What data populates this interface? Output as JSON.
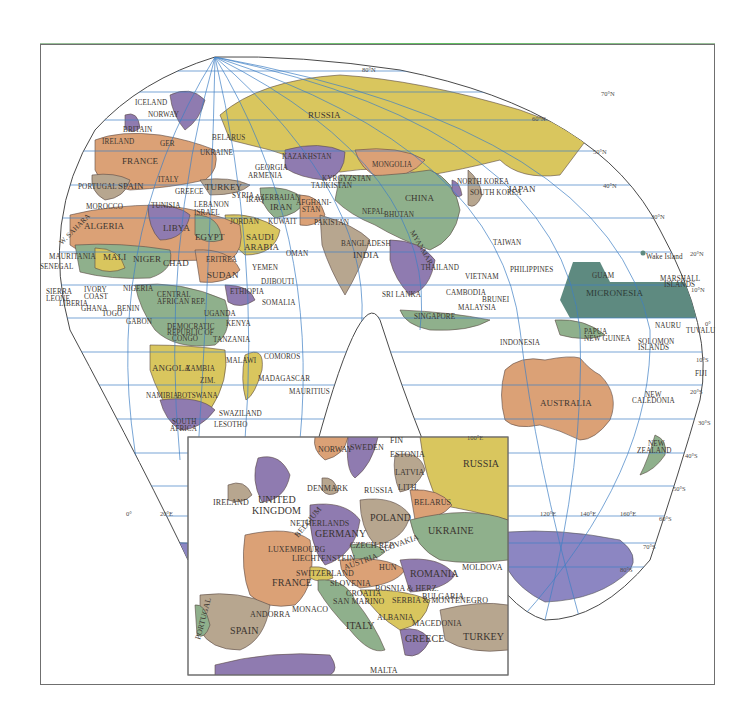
{
  "map": {
    "title": "World political map (Eurasia-centered) with Europe inset",
    "colors": {
      "yellow": "#d9c65e",
      "orange": "#dba176",
      "purple": "#8f7bb0",
      "green": "#8fb08c",
      "tan": "#b7a68f",
      "teal": "#5e8a80",
      "antarctica": "#8c86c2",
      "water": "#ffffff",
      "grid": "#3f7fc4",
      "border": "#5a4a44",
      "frame": "#6f6f6f"
    },
    "latitude_labels": [
      "80°N",
      "70°N",
      "60°N",
      "50°N",
      "40°N",
      "30°N",
      "20°N",
      "10°N",
      "0°",
      "10°S",
      "20°S",
      "30°S",
      "40°S",
      "50°S",
      "60°S",
      "70°S",
      "80°S"
    ],
    "longitude_labels": [
      "0°",
      "20°E",
      "100°E",
      "120°E",
      "140°E",
      "160°E"
    ],
    "countries": {
      "europe": [
        "ICELAND",
        "NORWAY",
        "SWEDEN",
        "BRITAIN",
        "IRELAND",
        "GER",
        "BELARUS",
        "UKRAINE",
        "FRANCE",
        "PORTUGAL",
        "SPAIN",
        "ITALY",
        "GREECE",
        "TURKEY"
      ],
      "asia": [
        "RUSSIA",
        "KAZAKHSTAN",
        "MONGOLIA",
        "KYRGYZSTAN",
        "TAJIKISTAN",
        "CHINA",
        "NORTH KOREA",
        "SOUTH KOREA",
        "JAPAN",
        "GEORGIA",
        "ARMENIA",
        "AZERBAIJAN",
        "IRAN",
        "IRAQ",
        "SYRIA",
        "LEBANON",
        "ISRAEL",
        "JORDAN",
        "KUWAIT",
        "SAUDI ARABIA",
        "YEMEN",
        "OMAN",
        "AFGHANISTAN",
        "PAKISTAN",
        "NEPAL",
        "BHUTAN",
        "BANGLADESH",
        "INDIA",
        "SRI LANKA",
        "MYANMAR",
        "THAILAND",
        "VIETNAM",
        "CAMBODIA",
        "MALAYSIA",
        "SINGAPORE",
        "BRUNEI",
        "PHILIPPINES",
        "TAIWAN",
        "INDONESIA"
      ],
      "africa": [
        "MOROCCO",
        "TUNISIA",
        "ALGERIA",
        "LIBYA",
        "EGYPT",
        "WESTERN SAHARA",
        "MAURITANIA",
        "MALI",
        "NIGER",
        "CHAD",
        "SUDAN",
        "ERITREA",
        "DJIBOUTI",
        "ETHIOPIA",
        "SOMALIA",
        "SENEGAL",
        "SIERRA LEONE",
        "LIBERIA",
        "IVORY COAST",
        "GHANA",
        "TOGO",
        "BENIN",
        "NIGERIA",
        "CENTRAL AFRICAN REP.",
        "GABON",
        "DEMOCRATIC REPUBLIC OF CONGO",
        "UGANDA",
        "KENYA",
        "TANZANIA",
        "COMOROS",
        "MALAWI",
        "ANGOLA",
        "ZAMBIA",
        "ZIMBABWE",
        "NAMIBIA",
        "BOTSWANA",
        "MADAGASCAR",
        "MAURITIUS",
        "SWAZILAND",
        "LESOTHO",
        "SOUTH AFRICA"
      ],
      "oceania": [
        "AUSTRALIA",
        "PAPUA NEW GUINEA",
        "SOLOMON ISLANDS",
        "NAURU",
        "TUVALU",
        "FIJI",
        "NEW CALEDONIA",
        "NEW ZEALAND",
        "MICRONESIA",
        "GUAM",
        "MARSHALL ISLANDS",
        "Wake Island"
      ]
    },
    "inset": {
      "title": "Europe",
      "countries": [
        "NORWAY",
        "SWEDEN",
        "FIN",
        "ESTONIA",
        "LATVIA",
        "LITH.",
        "RUSSIA",
        "DENMARK",
        "IRELAND",
        "UNITED KINGDOM",
        "NETHERLANDS",
        "BELGIUM",
        "GERMANY",
        "POLAND",
        "BELARUS",
        "UKRAINE",
        "LUXEMBOURG",
        "LIECHTENSTEIN",
        "CZECH REP.",
        "SLOVAKIA",
        "AUSTRIA",
        "HUN",
        "MOLDOVA",
        "ROMANIA",
        "SWITZERLAND",
        "FRANCE",
        "SLOVENIA",
        "CROATIA",
        "BOSNIA & HERZ.",
        "SERBIA & MONTENEGRO",
        "BULGARIA",
        "SAN MARINO",
        "MONACO",
        "ANDORRA",
        "PORTUGAL",
        "SPAIN",
        "ITALY",
        "ALBANIA",
        "MACEDONIA",
        "GREECE",
        "TURKEY",
        "MALTA"
      ]
    }
  },
  "labels": {
    "lat80": "80°N",
    "lat70": "70°N",
    "lat60": "60°N",
    "lat50": "50°N",
    "lat40": "40°N",
    "lat30": "30°N",
    "lat20": "20°N",
    "lat10": "10°N",
    "lat0": "0°",
    "lat10s": "10°S",
    "lat20s": "20°S",
    "lat30s": "30°S",
    "lat40s": "40°S",
    "lat50s": "50°S",
    "lat60s": "60°S",
    "lat70s": "70°S",
    "lat80s": "80°S",
    "lon0": "0°",
    "lon20e": "20°E",
    "lon100e": "100°E",
    "lon120e": "120°E",
    "lon140e": "140°E",
    "lon160e": "160°E",
    "iceland": "ICELAND",
    "norway": "NORWAY",
    "britain": "BRITAIN",
    "ireland": "IRELAND",
    "ger": "GER",
    "belarus": "BELARUS",
    "ukraine": "UKRAINE",
    "france": "FRANCE",
    "portugal": "PORTUGAL",
    "spain": "SPAIN",
    "italy": "ITALY",
    "greece": "GREECE",
    "turkey": "TURKEY",
    "russia": "RUSSIA",
    "kazakhstan": "KAZAKHSTAN",
    "mongolia": "MONGOLIA",
    "kyrgyzstan": "KYRGYZSTAN",
    "tajikistan": "TAJIKISTAN",
    "china": "CHINA",
    "nkorea": "NORTH KOREA",
    "skorea": "SOUTH KOREA",
    "japan": "JAPAN",
    "georgia": "GEORGIA",
    "armenia": "ARMENIA",
    "azerbaijan": "AZERBAIJAN",
    "iran": "IRAN",
    "iraq": "IRAQ",
    "syria": "SYRIA",
    "lebanon": "LEBANON",
    "israel": "ISRAEL",
    "jordan": "JORDAN",
    "kuwait": "KUWAIT",
    "saudi1": "SAUDI",
    "saudi2": "ARABIA",
    "yemen": "YEMEN",
    "oman": "OMAN",
    "afghanistan1": "AFGHANI-",
    "afghanistan2": "STAN",
    "pakistan": "PAKISTAN",
    "nepal": "NEPAL",
    "bhutan": "BHUTAN",
    "bangladesh": "BANGLADESH",
    "india": "INDIA",
    "srilanka": "SRI LANKA",
    "myanmar": "MYANMAR",
    "thailand": "THAILAND",
    "vietnam": "VIETNAM",
    "cambodia": "CAMBODIA",
    "malaysia": "MALAYSIA",
    "singapore": "SINGAPORE",
    "brunei": "BRUNEI",
    "philippines": "PHILIPPINES",
    "taiwan": "TAIWAN",
    "indonesia": "INDONESIA",
    "morocco": "MOROCCO",
    "tunisia": "TUNISIA",
    "algeria": "ALGERIA",
    "libya": "LIBYA",
    "egypt": "EGYPT",
    "wsahara": "W. SAHARA",
    "mauritania": "MAURITANIA",
    "mali": "MALI",
    "niger": "NIGER",
    "chad": "CHAD",
    "sudan": "SUDAN",
    "eritrea": "ERITREA",
    "djibouti": "DJIBOUTI",
    "ethiopia": "ETHIOPIA",
    "somalia": "SOMALIA",
    "senegal": "SENEGAL",
    "sierra1": "SIERRA",
    "sierra2": "LEONE",
    "liberia": "LIBERIA",
    "ivory1": "IVORY",
    "ivory2": "COAST",
    "ghana": "GHANA",
    "togo": "TOGO",
    "benin": "BENIN",
    "nigeria": "NIGERIA",
    "car1": "CENTRAL",
    "car2": "AFRICAN REP.",
    "gabon": "GABON",
    "drc1": "DEMOCRATIC",
    "drc2": "REPUBLIC OF",
    "drc3": "CONGO",
    "uganda": "UGANDA",
    "kenya": "KENYA",
    "tanzania": "TANZANIA",
    "comoros": "COMOROS",
    "malawi": "MALAWI",
    "angola": "ANGOLA",
    "zambia": "ZAMBIA",
    "zimbabwe": "ZIM.",
    "namibia": "NAMIBIA",
    "botswana": "BOTSWANA",
    "madagascar": "MADAGASCAR",
    "mauritius": "MAURITIUS",
    "swaziland": "SWAZILAND",
    "lesotho": "LESOTHO",
    "safrica1": "SOUTH",
    "safrica2": "AFRICA",
    "australia": "AUSTRALIA",
    "png1": "PAPUA",
    "png2": "NEW GUINEA",
    "solomon1": "SOLOMON",
    "solomon2": "ISLANDS",
    "nauru": "NAURU",
    "tuvalu": "TUVALU",
    "fiji": "FIJI",
    "newcal1": "NEW",
    "newcal2": "CALEDONIA",
    "nz1": "NEW",
    "nz2": "ZEALAND",
    "micronesia": "MICRONESIA",
    "guam": "GUAM",
    "marshall1": "MARSHALL",
    "marshall2": "ISLANDS",
    "wake": "Wake Island",
    "i_norway": "NORWAY",
    "i_sweden": "SWEDEN",
    "i_fin": "FIN",
    "i_estonia": "ESTONIA",
    "i_latvia": "LATVIA",
    "i_lith": "LITH.",
    "i_russia_k": "RUSSIA",
    "i_russia": "RUSSIA",
    "i_denmark": "DENMARK",
    "i_ireland": "IRELAND",
    "i_uk1": "UNITED",
    "i_uk2": "KINGDOM",
    "i_netherlands": "NETHERLANDS",
    "i_belgium": "BELGIUM",
    "i_germany": "GERMANY",
    "i_poland": "POLAND",
    "i_belarus": "BELARUS",
    "i_ukraine": "UKRAINE",
    "i_lux": "LUXEMBOURG",
    "i_liech": "LIECHTENSTEIN",
    "i_czech": "CZECH REP.",
    "i_slovakia": "SLOVAKIA",
    "i_austria": "AUSTRIA",
    "i_hun": "HUN",
    "i_moldova": "MOLDOVA",
    "i_romania": "ROMANIA",
    "i_switz": "SWITZERLAND",
    "i_france": "FRANCE",
    "i_slovenia": "SLOVENIA",
    "i_croatia": "CROATIA",
    "i_bosnia": "BOSNIA & HERZ.",
    "i_serbia": "SERBIA & MONTENEGRO",
    "i_bulgaria": "BULGARIA",
    "i_sanmarino": "SAN MARINO",
    "i_monaco": "MONACO",
    "i_andorra": "ANDORRA",
    "i_portugal": "PORTUGAL",
    "i_spain": "SPAIN",
    "i_italy": "ITALY",
    "i_albania": "ALBANIA",
    "i_macedonia": "MACEDONIA",
    "i_greece": "GREECE",
    "i_turkey": "TURKEY",
    "i_malta": "MALTA"
  }
}
